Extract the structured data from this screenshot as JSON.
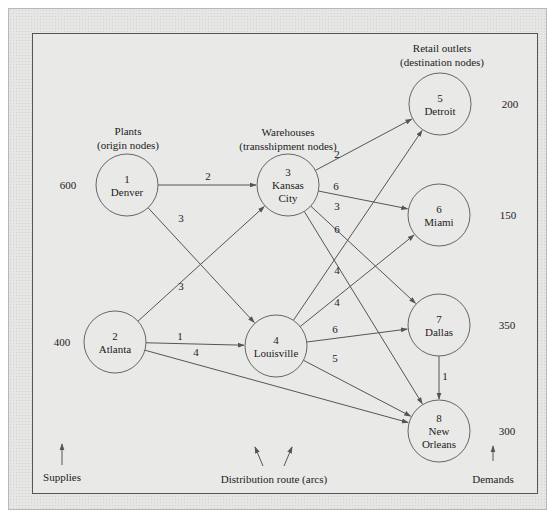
{
  "headers": {
    "plants": [
      "Plants",
      "(origin nodes)"
    ],
    "warehouses": [
      "Warehouses",
      "(transshipment nodes)"
    ],
    "retail": [
      "Retail outlets",
      "(destination nodes)"
    ]
  },
  "nodes": [
    {
      "id": "1",
      "name": [
        "Denver"
      ],
      "cx": 127,
      "cy": 185,
      "value": "600",
      "vx": 68,
      "vy": 189
    },
    {
      "id": "2",
      "name": [
        "Atlanta"
      ],
      "cx": 115,
      "cy": 342,
      "value": "400",
      "vx": 62,
      "vy": 346
    },
    {
      "id": "3",
      "name": [
        "Kansas",
        "City"
      ],
      "cx": 288,
      "cy": 185,
      "value": "",
      "vx": 0,
      "vy": 0
    },
    {
      "id": "4",
      "name": [
        "Louisville"
      ],
      "cx": 276,
      "cy": 346,
      "value": "",
      "vx": 0,
      "vy": 0
    },
    {
      "id": "5",
      "name": [
        "Detroit"
      ],
      "cx": 440,
      "cy": 104,
      "value": "200",
      "vx": 510,
      "vy": 108
    },
    {
      "id": "6",
      "name": [
        "Miami"
      ],
      "cx": 439,
      "cy": 215,
      "value": "150",
      "vx": 508,
      "vy": 219
    },
    {
      "id": "7",
      "name": [
        "Dallas"
      ],
      "cx": 439,
      "cy": 325,
      "value": "350",
      "vx": 507,
      "vy": 329
    },
    {
      "id": "8",
      "name": [
        "New",
        "Orleans"
      ],
      "cx": 439,
      "cy": 431,
      "value": "300",
      "vx": 507,
      "vy": 435
    }
  ],
  "arcs": [
    {
      "from": "1",
      "to": "3",
      "cost": "2",
      "lx": 208,
      "ly": 180
    },
    {
      "from": "1",
      "to": "4",
      "cost": "3",
      "lx": 181,
      "ly": 222
    },
    {
      "from": "2",
      "to": "3",
      "cost": "3",
      "lx": 181,
      "ly": 290
    },
    {
      "from": "2",
      "to": "4",
      "cost": "1",
      "lx": 180,
      "ly": 340
    },
    {
      "from": "2",
      "to": "8",
      "cost": "4",
      "lx": 196,
      "ly": 356
    },
    {
      "from": "3",
      "to": "5",
      "cost": "2",
      "lx": 337,
      "ly": 158
    },
    {
      "from": "3",
      "to": "6",
      "cost": "6",
      "lx": 336,
      "ly": 190
    },
    {
      "from": "3",
      "to": "7",
      "cost": "3",
      "lx": 337,
      "ly": 210
    },
    {
      "from": "3",
      "to": "8",
      "cost": "6",
      "lx": 337,
      "ly": 233
    },
    {
      "from": "4",
      "to": "5",
      "cost": "4",
      "lx": 337,
      "ly": 274
    },
    {
      "from": "4",
      "to": "6",
      "cost": "4",
      "lx": 337,
      "ly": 306
    },
    {
      "from": "4",
      "to": "7",
      "cost": "6",
      "lx": 335,
      "ly": 333
    },
    {
      "from": "4",
      "to": "8",
      "cost": "5",
      "lx": 335,
      "ly": 362
    },
    {
      "from": "7",
      "to": "8",
      "cost": "1",
      "lx": 445,
      "ly": 380
    }
  ],
  "annotations": {
    "supplies": "Supplies",
    "routes": "Distribution route (arcs)",
    "demands": "Demands"
  },
  "colors": {
    "line": "#555555",
    "circle": "#666666"
  }
}
